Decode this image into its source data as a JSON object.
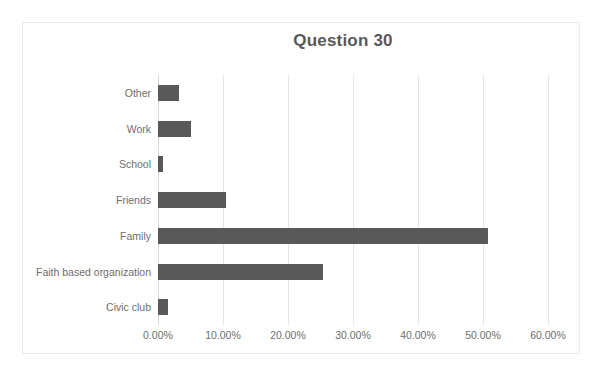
{
  "chart_data": {
    "type": "bar",
    "orientation": "horizontal",
    "title": "Question 30",
    "xlabel": "",
    "ylabel": "",
    "xlim": [
      0,
      60
    ],
    "xticks": [
      0,
      10,
      20,
      30,
      40,
      50,
      60
    ],
    "xtick_labels": [
      "0.00%",
      "10.00%",
      "20.00%",
      "30.00%",
      "40.00%",
      "50.00%",
      "60.00%"
    ],
    "grid": "vertical",
    "legend": "none",
    "bar_color": "#595959",
    "plot_background": "#ffffff",
    "gridline_color": "#e3e3e3",
    "text_color": "#6e6e6e",
    "title_color": "#595959",
    "categories": [
      "Other",
      "Work",
      "School",
      "Friends",
      "Family",
      "Faith based organization",
      "Civic club"
    ],
    "values": [
      3.2,
      5.1,
      0.7,
      10.5,
      50.7,
      25.4,
      1.5
    ],
    "value_labels": [
      "3.20%",
      "5.10%",
      "0.70%",
      "10.50%",
      "50.70%",
      "25.40%",
      "1.50%"
    ],
    "series": [
      {
        "name": "Question 30",
        "values": [
          3.2,
          5.1,
          0.7,
          10.5,
          50.7,
          25.4,
          1.5
        ]
      }
    ]
  },
  "chart": {
    "title": "Question 30"
  }
}
